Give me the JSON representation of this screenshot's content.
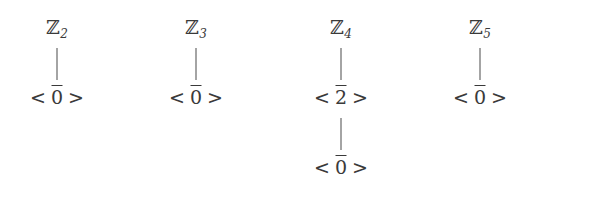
{
  "figure": {
    "name": "subgroup-lattice-diagrams",
    "background_color": "#ffffff",
    "stroke_color": "#3a3a3a",
    "edge_color": "#4a4a4a"
  },
  "lattices": [
    {
      "id": "z2",
      "group_letter": "ℤ",
      "group_subscript": "2",
      "group_label": "ℤ2",
      "nodes": [
        {
          "kind": "group",
          "open": "",
          "generator": "",
          "close": "",
          "overline": false
        },
        {
          "kind": "subgroup",
          "open": "<",
          "generator": "0",
          "close": ">",
          "overline": true
        }
      ]
    },
    {
      "id": "z3",
      "group_letter": "ℤ",
      "group_subscript": "3",
      "group_label": "ℤ3",
      "nodes": [
        {
          "kind": "group",
          "open": "",
          "generator": "",
          "close": "",
          "overline": false
        },
        {
          "kind": "subgroup",
          "open": "<",
          "generator": "0",
          "close": ">",
          "overline": true
        }
      ]
    },
    {
      "id": "z4",
      "group_letter": "ℤ",
      "group_subscript": "4",
      "group_label": "ℤ4",
      "nodes": [
        {
          "kind": "group",
          "open": "",
          "generator": "",
          "close": "",
          "overline": false
        },
        {
          "kind": "subgroup",
          "open": "<",
          "generator": "2",
          "close": ">",
          "overline": true
        },
        {
          "kind": "subgroup",
          "open": "<",
          "generator": "0",
          "close": ">",
          "overline": true
        }
      ]
    },
    {
      "id": "z5",
      "group_letter": "ℤ",
      "group_subscript": "5",
      "group_label": "ℤ5",
      "nodes": [
        {
          "kind": "group",
          "open": "",
          "generator": "",
          "close": "",
          "overline": false
        },
        {
          "kind": "subgroup",
          "open": "<",
          "generator": "0",
          "close": ">",
          "overline": true
        }
      ]
    }
  ]
}
